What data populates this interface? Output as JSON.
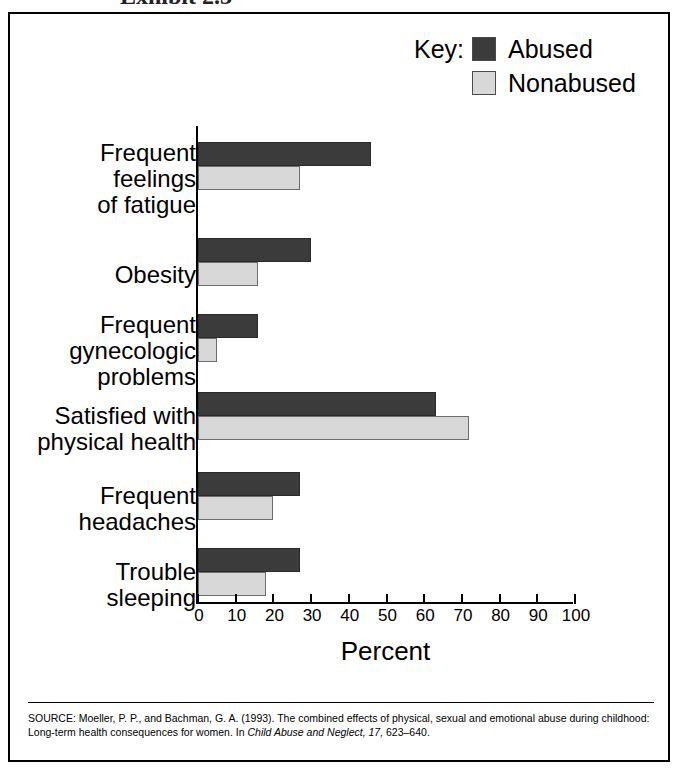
{
  "top_crop_text": "Exhibit 2.3",
  "legend": {
    "key_label": "Key:",
    "entries": [
      {
        "label": "Abused",
        "color": "#3b3b3b"
      },
      {
        "label": "Nonabused",
        "color": "#d8d8d8"
      }
    ]
  },
  "axis": {
    "title": "Percent",
    "ticks": [
      "0",
      "10",
      "20",
      "30",
      "40",
      "50",
      "60",
      "70",
      "80",
      "90",
      "100"
    ]
  },
  "source": {
    "prefix": "SOURCE: Moeller, P. P., and Bachman, G. A. (1993). The combined effects of physical, sexual and emotional abuse during childhood: Long-term health consequences for women. In ",
    "journal": "Child Abuse and Neglect, 17,",
    "pages": " 623–640."
  },
  "chart_data": {
    "type": "bar",
    "orientation": "horizontal",
    "title": "",
    "xlabel": "Percent",
    "ylabel": "",
    "xlim": [
      0,
      100
    ],
    "grid": false,
    "legend_position": "top-right",
    "categories": [
      "Frequent\nfeelings\nof fatigue",
      "Obesity",
      "Frequent\ngynecologic\nproblems",
      "Satisfied with\nphysical health",
      "Frequent\nheadaches",
      "Trouble\nsleeping"
    ],
    "series": [
      {
        "name": "Abused",
        "color": "#3b3b3b",
        "values": [
          46,
          30,
          16,
          63,
          27,
          27
        ]
      },
      {
        "name": "Nonabused",
        "color": "#d8d8d8",
        "values": [
          27,
          16,
          5,
          72,
          20,
          18
        ]
      }
    ]
  }
}
